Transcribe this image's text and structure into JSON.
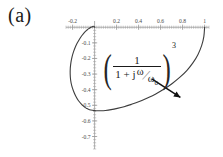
{
  "panel": {
    "label": "(a)"
  },
  "formula": {
    "open_paren": "(",
    "close_paren": ")",
    "numerator": "1",
    "denominator_prefix": "1 + j",
    "omega_numerator": "ω",
    "slash": "⁄",
    "omega_denominator": "ω",
    "omega_subscript": "0",
    "exponent": "3"
  },
  "chart_data": {
    "type": "line",
    "title": "",
    "subtitle": "",
    "xlabel": "",
    "ylabel": "",
    "annotation": "(1/(1+jω/ω₀))^3",
    "grid": false,
    "legend_position": "none",
    "xlim": [
      -0.26,
      1.04
    ],
    "ylim": [
      -0.78,
      0.04
    ],
    "x_ticks": [
      -0.2,
      0.2,
      0.4,
      0.6,
      0.8,
      1
    ],
    "x_tick_labels": [
      "-0.2",
      "0.2",
      "0.4",
      "0.6",
      "0.8",
      "1"
    ],
    "y_ticks": [
      -0.1,
      -0.2,
      -0.3,
      -0.4,
      -0.5,
      -0.6,
      -0.7
    ],
    "y_tick_labels": [
      "-0.1",
      "-0.2",
      "-0.3",
      "-0.4",
      "-0.5",
      "-0.6",
      "-0.7"
    ],
    "x_minor_tick_step": 0.02,
    "y_minor_tick_step": 0.02,
    "series": [
      {
        "name": "Nyquist locus",
        "color": "#3d3d3d",
        "x": [
          1.0,
          0.993,
          0.973,
          0.94,
          0.895,
          0.84,
          0.776,
          0.706,
          0.632,
          0.556,
          0.48,
          0.406,
          0.335,
          0.268,
          0.206,
          0.15,
          0.099,
          0.054,
          0.015,
          -0.018,
          -0.046,
          -0.069,
          -0.088,
          -0.118,
          -0.148,
          -0.172,
          -0.192,
          -0.208,
          -0.218,
          -0.222,
          -0.221,
          -0.215,
          -0.205,
          -0.192,
          -0.176,
          -0.158,
          -0.139,
          -0.12,
          -0.101,
          -0.083,
          -0.066,
          -0.051,
          -0.038,
          -0.026,
          -0.017,
          -0.01,
          -0.005,
          -0.002,
          0.0
        ],
        "y": [
          0.0,
          -0.06,
          -0.118,
          -0.174,
          -0.227,
          -0.276,
          -0.32,
          -0.36,
          -0.396,
          -0.427,
          -0.453,
          -0.476,
          -0.494,
          -0.509,
          -0.52,
          -0.528,
          -0.533,
          -0.535,
          -0.535,
          -0.532,
          -0.528,
          -0.521,
          -0.513,
          -0.494,
          -0.469,
          -0.44,
          -0.408,
          -0.374,
          -0.338,
          -0.3,
          -0.262,
          -0.225,
          -0.19,
          -0.158,
          -0.128,
          -0.101,
          -0.078,
          -0.058,
          -0.041,
          -0.027,
          -0.016,
          -0.008,
          -0.002,
          0.002,
          0.005,
          0.006,
          0.005,
          0.003,
          0.0
        ]
      }
    ],
    "arrow": {
      "from": [
        0.52,
        -0.33
      ],
      "to": [
        0.78,
        -0.45
      ],
      "color": "#111111"
    }
  }
}
